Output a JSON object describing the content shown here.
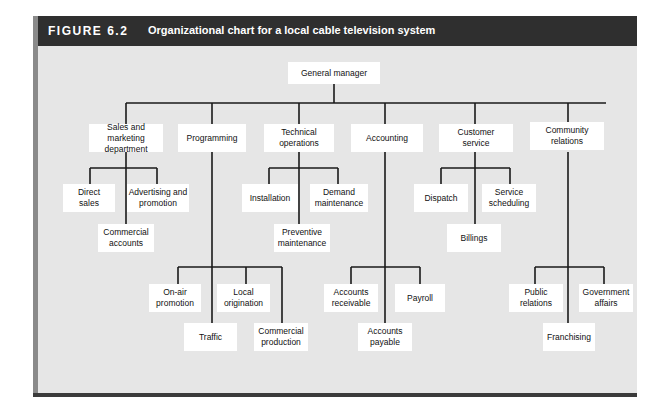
{
  "figure": {
    "number": "FIGURE 6.2",
    "title": "Organizational chart for a local cable television system"
  },
  "nodes": {
    "gm": "General manager",
    "sales": "Sales and marketing\ndepartment",
    "programming": "Programming",
    "technical": "Technical\noperations",
    "accounting": "Accounting",
    "customer": "Customer\nservice",
    "community": "Community\nrelations",
    "direct_sales": "Direct\nsales",
    "advertising": "Advertising and\npromotion",
    "commercial_accounts": "Commercial\naccounts",
    "installation": "Installation",
    "demand": "Demand\nmaintenance",
    "preventive": "Preventive\nmaintenance",
    "dispatch": "Dispatch",
    "service_scheduling": "Service\nscheduling",
    "billings": "Billings",
    "onair": "On-air\npromotion",
    "local": "Local\norigination",
    "traffic": "Traffic",
    "commercial_production": "Commercial\nproduction",
    "receivable": "Accounts\nreceivable",
    "payroll": "Payroll",
    "payable": "Accounts\npayable",
    "public_relations": "Public\nrelations",
    "government": "Government\naffairs",
    "franchising": "Franchising"
  },
  "colors": {
    "header_bg": "#2f2f2f",
    "panel_bg": "#e6e6e6",
    "box_bg": "#ffffff",
    "line": "#1a1a1a"
  }
}
